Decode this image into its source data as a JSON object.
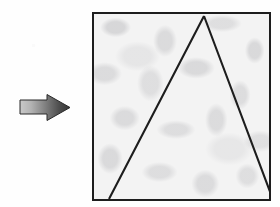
{
  "figure": {
    "caption": "",
    "background_color": "#fefefe",
    "ink_color": "#1d1d1d",
    "elements": [
      {
        "name": "arrow",
        "label": "",
        "shape": "block-arrow",
        "direction": "right",
        "gradient_from": "#c2c2c2",
        "gradient_to": "#3c3c3c",
        "outline_color": "#2a2a2a",
        "x": 18,
        "y": 92,
        "width": 54,
        "height": 32
      },
      {
        "name": "textured-square",
        "label": "",
        "shape": "square",
        "fill": "marble-texture",
        "fill_color": "#f3f3f3",
        "speckle_color": "#96969b",
        "border_color": "#1d1d1d",
        "border_width": 2,
        "x": 92,
        "y": 12,
        "width": 179,
        "height": 189
      },
      {
        "name": "triangle",
        "label": "",
        "shape": "triangle",
        "stroke_color": "#1d1d1d",
        "stroke_width": 2,
        "fill": "none",
        "apex_touches": "top-edge",
        "vertices": [
          {
            "name": "apex",
            "x": 110,
            "y": 2
          },
          {
            "name": "bottom-left",
            "x": 15,
            "y": 185
          },
          {
            "name": "bottom-right",
            "x": 178,
            "y": 183
          }
        ]
      }
    ]
  },
  "arrow": {
    "tail_top": 8,
    "tail_bottom": 22,
    "tail_left": 2,
    "head_start": 28,
    "head_top": 3,
    "head_bottom": 28,
    "tip_x": 52,
    "tip_y": 15
  },
  "triangle_geometry": {
    "apex_x": 110,
    "apex_y": 2,
    "left_base_x": 15,
    "left_base_y": 185,
    "right_base_x": 178,
    "right_base_y": 183
  }
}
